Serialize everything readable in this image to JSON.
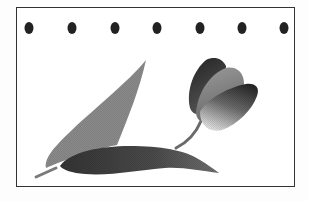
{
  "illustration": {
    "subject": "tulip with leaves",
    "frame": {
      "border_color": "#333333",
      "background": "#ffffff"
    },
    "dots": {
      "count": 7,
      "color": "#222222",
      "y": 28,
      "x_positions": [
        29,
        72,
        115,
        157,
        200,
        242,
        284
      ]
    },
    "colors": {
      "upright_leaf": "#8a8a8a",
      "horizontal_leaf_dark": "#3a3a3a",
      "horizontal_leaf_light": "#7a7a7a",
      "stem": "#6a6a6a",
      "petal_back": "#2e2e2e",
      "petal_middle": "#8c8c8c",
      "petal_front_dark": "#2a2a2a",
      "petal_front_light": "#d8d8d8"
    }
  }
}
